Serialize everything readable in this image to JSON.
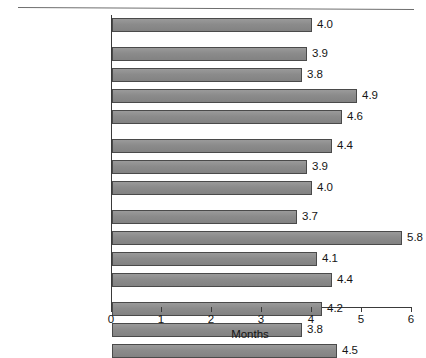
{
  "chart_data": {
    "type": "bar",
    "orientation": "horizontal",
    "title": "",
    "xlabel": "Months",
    "ylabel": "",
    "xlim": [
      0,
      6
    ],
    "xticks": [
      0,
      1,
      2,
      3,
      4,
      5,
      6
    ],
    "xtick_labels": [
      "0",
      "1",
      "2",
      "3",
      "4",
      "5",
      "6"
    ],
    "grid": false,
    "legend": null,
    "bar_color": "#8e8e8e",
    "bar_edge_color": "#4a4a4a",
    "value_label_format": "0.0",
    "categories": [
      "All",
      "White",
      "White, not Hispanic",
      "Black",
      "Hispanic",
      "0 to 17 years",
      "18 to 64 years",
      "65 years and over",
      "Married-couple family",
      "Female householder",
      "Male householder",
      "Unrelated individual",
      "Central city",
      "Suburbs",
      "Nonmetropolitan"
    ],
    "values": [
      4.0,
      3.9,
      3.8,
      4.9,
      4.6,
      4.4,
      3.9,
      4.0,
      3.7,
      5.8,
      4.1,
      4.4,
      4.2,
      3.8,
      4.5
    ],
    "value_labels": [
      "4.0",
      "3.9",
      "3.8",
      "4.9",
      "4.6",
      "4.4",
      "3.9",
      "4.0",
      "3.7",
      "5.8",
      "4.1",
      "4.4",
      "4.2",
      "3.8",
      "4.5"
    ],
    "groups": [
      {
        "name": "",
        "categories": [
          "All"
        ]
      },
      {
        "name": "",
        "categories": [
          "White",
          "White, not Hispanic",
          "Black",
          "Hispanic"
        ]
      },
      {
        "name": "",
        "categories": [
          "0 to 17 years",
          "18 to 64 years",
          "65 years and over"
        ]
      },
      {
        "name": "",
        "categories": [
          "Married-couple family",
          "Female householder",
          "Male householder",
          "Unrelated individual"
        ]
      },
      {
        "name": "",
        "categories": [
          "Central city",
          "Suburbs",
          "Nonmetropolitan"
        ]
      }
    ]
  }
}
